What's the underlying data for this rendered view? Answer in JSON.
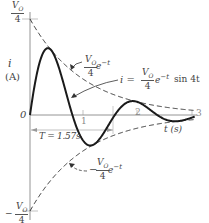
{
  "figure": {
    "y_axis_label_i": "i",
    "y_axis_label_unit": "(A)",
    "x_axis_label": "t (s)",
    "origin_label": "0",
    "top_tick": {
      "num": "V",
      "sub": "O",
      "den": "4"
    },
    "bottom_tick": {
      "sign": "−",
      "num": "V",
      "sub": "O",
      "den": "4"
    },
    "x_ticks": [
      "1",
      "2",
      "3"
    ],
    "period_label": "T = 1.57s",
    "upper_envelope_label": {
      "num": "V",
      "sub": "O",
      "den": "4",
      "tail": "e",
      "exp": "−t"
    },
    "curve_label": {
      "prefix": "i =",
      "num": "V",
      "sub": "O",
      "den": "4",
      "tail": "e",
      "exp": "−t",
      "suffix": "sin 4t"
    },
    "lower_envelope_label": {
      "sign": "−",
      "num": "V",
      "sub": "O",
      "den": "4",
      "tail": "e",
      "exp": "−t"
    }
  },
  "chart_data": {
    "type": "line",
    "title": "",
    "xlabel": "t (s)",
    "ylabel": "i (A)",
    "xlim": [
      0,
      3
    ],
    "ylim": [
      -0.25,
      0.25
    ],
    "y_units": "V0",
    "series": [
      {
        "name": "i = (V0/4) e^-t sin 4t",
        "style": "solid",
        "x": [
          0,
          0.2,
          0.39,
          0.6,
          0.785,
          1.0,
          1.18,
          1.4,
          1.57,
          1.8,
          1.96,
          2.2,
          2.36,
          2.6,
          2.75,
          3.0
        ],
        "y": [
          0,
          0.147,
          0.17,
          0.093,
          0,
          -0.093,
          -0.077,
          -0.039,
          0,
          0.034,
          0.028,
          0.011,
          0,
          -0.014,
          -0.016,
          -0.007
        ]
      },
      {
        "name": "(V0/4) e^-t",
        "style": "dashed",
        "x": [
          0,
          0.5,
          1,
          1.5,
          2,
          2.5,
          3
        ],
        "y": [
          0.25,
          0.152,
          0.092,
          0.056,
          0.034,
          0.021,
          0.012
        ]
      },
      {
        "name": "-(V0/4) e^-t",
        "style": "dashed",
        "x": [
          0,
          0.5,
          1,
          1.5,
          2,
          2.5,
          3
        ],
        "y": [
          -0.25,
          -0.152,
          -0.092,
          -0.056,
          -0.034,
          -0.021,
          -0.012
        ]
      }
    ],
    "annotations": [
      "T = 1.57s",
      "V0/4",
      "-V0/4"
    ],
    "grid": false,
    "legend": "none"
  }
}
